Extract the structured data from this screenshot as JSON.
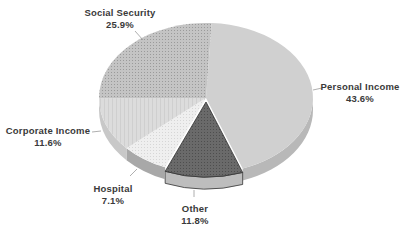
{
  "chart_data": {
    "type": "pie",
    "style": "3d",
    "title": "",
    "categories": [
      "Personal Income",
      "Other",
      "Hospital",
      "Corporate Income",
      "Social Security"
    ],
    "values": [
      43.6,
      11.8,
      7.1,
      11.6,
      25.9
    ],
    "value_labels": [
      "43.6%",
      "11.8%",
      "7.1%",
      "11.6%",
      "25.9%"
    ],
    "exploded": [
      "Other"
    ],
    "legend": "none (labels placed beside slices with leader lines)",
    "colors": {
      "Personal Income": "#cfcfcf",
      "Other": "#6e6e6e",
      "Hospital": "#ececec",
      "Corporate Income": "#dadada",
      "Social Security": "#bdbdbd"
    }
  },
  "labels": {
    "personal": {
      "name": "Personal Income",
      "pct": "43.6%"
    },
    "other": {
      "name": "Other",
      "pct": "11.8%"
    },
    "hospital": {
      "name": "Hospital",
      "pct": "7.1%"
    },
    "corporate": {
      "name": "Corporate Income",
      "pct": "11.6%"
    },
    "social": {
      "name": "Social Security",
      "pct": "25.9%"
    }
  }
}
